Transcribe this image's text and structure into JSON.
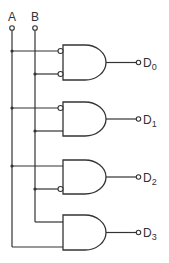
{
  "diagram": {
    "inputs": [
      {
        "id": "A",
        "label": "A",
        "x": 12
      },
      {
        "id": "B",
        "label": "B",
        "x": 35
      }
    ],
    "gates": [
      {
        "id": "gate-0",
        "type": "AND",
        "output": {
          "label": "D",
          "subscript": "0"
        },
        "inputs": [
          {
            "source": "A",
            "inverted": true
          },
          {
            "source": "B",
            "inverted": true
          }
        ],
        "top": 45
      },
      {
        "id": "gate-1",
        "type": "AND",
        "output": {
          "label": "D",
          "subscript": "1"
        },
        "inputs": [
          {
            "source": "A",
            "inverted": true
          },
          {
            "source": "B",
            "inverted": false
          }
        ],
        "top": 102
      },
      {
        "id": "gate-2",
        "type": "AND",
        "output": {
          "label": "D",
          "subscript": "2"
        },
        "inputs": [
          {
            "source": "A",
            "inverted": false
          },
          {
            "source": "B",
            "inverted": true
          }
        ],
        "top": 160
      },
      {
        "id": "gate-3",
        "type": "AND",
        "output": {
          "label": "D",
          "subscript": "3"
        },
        "inputs": [
          {
            "source": "B",
            "inverted": false
          },
          {
            "source": "A",
            "inverted": false
          }
        ],
        "top": 215
      }
    ],
    "colors": {
      "line": "#333333",
      "background": "#ffffff"
    }
  }
}
